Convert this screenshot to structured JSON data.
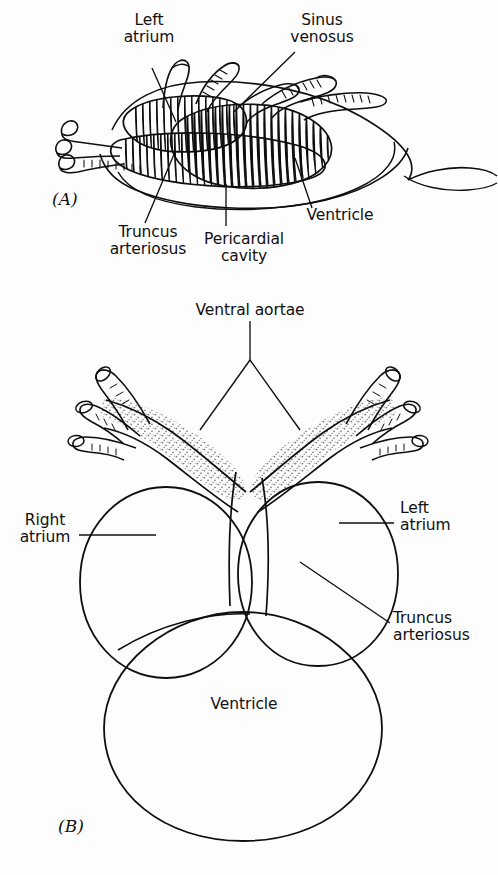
{
  "figure": {
    "background_color": "#fdfdfd",
    "ink_color": "#0f0f0f",
    "text_color": "#101010"
  },
  "panel_a": {
    "marker": "(A)",
    "labels": {
      "left_atrium": "Left\natrium",
      "sinus_venosus": "Sinus\nvenosus",
      "truncus_arteriosus": "Truncus\narteriosus",
      "pericardial_cavity": "Pericardial\ncavity",
      "ventricle": "Ventricle"
    }
  },
  "panel_b": {
    "marker": "(B)",
    "labels": {
      "ventral_aortae": "Ventral aortae",
      "right_atrium": "Right\natrium",
      "left_atrium": "Left\natrium",
      "truncus_arteriosus": "Truncus\narteriosus",
      "ventricle": "Ventricle"
    }
  }
}
